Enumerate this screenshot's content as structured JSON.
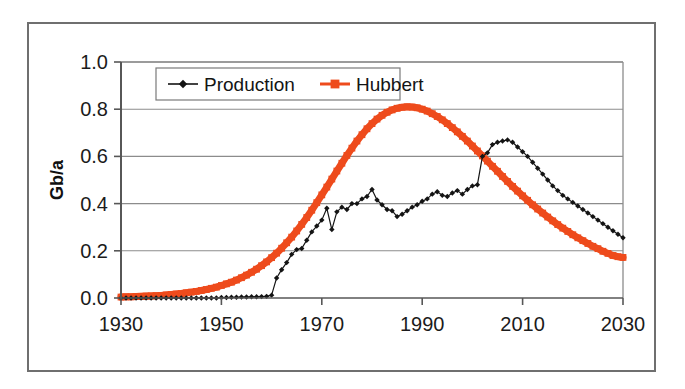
{
  "figure": {
    "background_color": "#ffffff",
    "frame_color": "#6f6f6f",
    "axis_color": "#575757",
    "grid_color": "#8c8c8c"
  },
  "chart_data": {
    "type": "line",
    "title": "",
    "subtitle": "",
    "xlabel": "",
    "ylabel": "Gb/a",
    "xlim": [
      1930,
      2030
    ],
    "ylim": [
      0.0,
      1.0
    ],
    "grid": true,
    "grid_axis": "y",
    "legend_position": "top-left-inside",
    "xticks": [
      1930,
      1950,
      1970,
      1990,
      2010,
      2030
    ],
    "xtick_labels": [
      "1930",
      "1950",
      "1970",
      "1990",
      "2010",
      "2030"
    ],
    "yticks": [
      0.0,
      0.2,
      0.4,
      0.6,
      0.8,
      1.0
    ],
    "ytick_labels": [
      "0.0",
      "0.2",
      "0.4",
      "0.6",
      "0.8",
      "1.0"
    ],
    "series": [
      {
        "name": "Production",
        "color": "#141414",
        "marker": "diamond",
        "line_width": 1.2,
        "x": [
          1930,
          1931,
          1932,
          1933,
          1934,
          1935,
          1936,
          1937,
          1938,
          1939,
          1940,
          1941,
          1942,
          1943,
          1944,
          1945,
          1946,
          1947,
          1948,
          1949,
          1950,
          1951,
          1952,
          1953,
          1954,
          1955,
          1956,
          1957,
          1958,
          1959,
          1960,
          1961,
          1962,
          1963,
          1964,
          1965,
          1966,
          1967,
          1968,
          1969,
          1970,
          1971,
          1972,
          1973,
          1974,
          1975,
          1976,
          1977,
          1978,
          1979,
          1980,
          1981,
          1982,
          1983,
          1984,
          1985,
          1986,
          1987,
          1988,
          1989,
          1990,
          1991,
          1992,
          1993,
          1994,
          1995,
          1996,
          1997,
          1998,
          1999,
          2000,
          2001,
          2002,
          2003,
          2004,
          2005,
          2006,
          2007,
          2008,
          2009,
          2010,
          2011,
          2012,
          2013,
          2014,
          2015,
          2016,
          2017,
          2018,
          2019,
          2020,
          2021,
          2022,
          2023,
          2024,
          2025,
          2026,
          2027,
          2028,
          2029,
          2030
        ],
        "y": [
          0.0,
          0.0,
          0.0,
          0.0,
          0.0,
          0.0,
          0.0,
          0.0,
          0.0,
          0.0,
          0.0,
          0.0,
          0.0,
          0.0,
          0.0,
          0.0,
          0.0,
          0.0,
          0.0,
          0.0,
          0.002,
          0.002,
          0.003,
          0.003,
          0.004,
          0.004,
          0.005,
          0.005,
          0.006,
          0.007,
          0.012,
          0.085,
          0.12,
          0.15,
          0.185,
          0.205,
          0.21,
          0.245,
          0.28,
          0.305,
          0.33,
          0.38,
          0.29,
          0.365,
          0.385,
          0.375,
          0.4,
          0.4,
          0.42,
          0.43,
          0.46,
          0.415,
          0.395,
          0.375,
          0.37,
          0.345,
          0.355,
          0.37,
          0.385,
          0.395,
          0.41,
          0.42,
          0.44,
          0.45,
          0.435,
          0.43,
          0.445,
          0.455,
          0.44,
          0.46,
          0.475,
          0.48,
          0.6,
          0.615,
          0.65,
          0.66,
          0.665,
          0.67,
          0.66,
          0.64,
          0.62,
          0.6,
          0.575,
          0.55,
          0.525,
          0.5,
          0.475,
          0.455,
          0.435,
          0.42,
          0.405,
          0.39,
          0.375,
          0.36,
          0.345,
          0.33,
          0.315,
          0.3,
          0.285,
          0.27,
          0.255
        ]
      },
      {
        "name": "Hubbert",
        "color": "#ee4b1c",
        "marker": "square",
        "line_width": 7,
        "x": [
          1930,
          1931,
          1932,
          1933,
          1934,
          1935,
          1936,
          1937,
          1938,
          1939,
          1940,
          1941,
          1942,
          1943,
          1944,
          1945,
          1946,
          1947,
          1948,
          1949,
          1950,
          1951,
          1952,
          1953,
          1954,
          1955,
          1956,
          1957,
          1958,
          1959,
          1960,
          1961,
          1962,
          1963,
          1964,
          1965,
          1966,
          1967,
          1968,
          1969,
          1970,
          1971,
          1972,
          1973,
          1974,
          1975,
          1976,
          1977,
          1978,
          1979,
          1980,
          1981,
          1982,
          1983,
          1984,
          1985,
          1986,
          1987,
          1988,
          1989,
          1990,
          1991,
          1992,
          1993,
          1994,
          1995,
          1996,
          1997,
          1998,
          1999,
          2000,
          2001,
          2002,
          2003,
          2004,
          2005,
          2006,
          2007,
          2008,
          2009,
          2010,
          2011,
          2012,
          2013,
          2014,
          2015,
          2016,
          2017,
          2018,
          2019,
          2020,
          2021,
          2022,
          2023,
          2024,
          2025,
          2026,
          2027,
          2028,
          2029,
          2030
        ],
        "y": [
          0.004,
          0.005,
          0.005,
          0.006,
          0.007,
          0.008,
          0.009,
          0.01,
          0.011,
          0.013,
          0.015,
          0.017,
          0.019,
          0.022,
          0.025,
          0.028,
          0.032,
          0.036,
          0.041,
          0.046,
          0.053,
          0.06,
          0.067,
          0.076,
          0.086,
          0.097,
          0.109,
          0.122,
          0.137,
          0.153,
          0.171,
          0.19,
          0.211,
          0.234,
          0.258,
          0.284,
          0.312,
          0.341,
          0.372,
          0.404,
          0.437,
          0.47,
          0.504,
          0.538,
          0.571,
          0.604,
          0.635,
          0.665,
          0.692,
          0.717,
          0.739,
          0.758,
          0.774,
          0.787,
          0.797,
          0.804,
          0.808,
          0.81,
          0.809,
          0.806,
          0.8,
          0.792,
          0.781,
          0.769,
          0.755,
          0.739,
          0.722,
          0.704,
          0.685,
          0.665,
          0.644,
          0.623,
          0.602,
          0.58,
          0.558,
          0.537,
          0.515,
          0.494,
          0.473,
          0.453,
          0.433,
          0.414,
          0.395,
          0.377,
          0.36,
          0.343,
          0.327,
          0.311,
          0.296,
          0.282,
          0.268,
          0.255,
          0.243,
          0.231,
          0.219,
          0.209,
          0.198,
          0.189,
          0.18,
          0.175,
          0.172
        ]
      }
    ],
    "annotations": []
  },
  "legend": {
    "items": [
      {
        "label": "Production",
        "color": "#141414",
        "marker": "diamond"
      },
      {
        "label": "Hubbert",
        "color": "#ee4b1c",
        "marker": "square"
      }
    ]
  }
}
